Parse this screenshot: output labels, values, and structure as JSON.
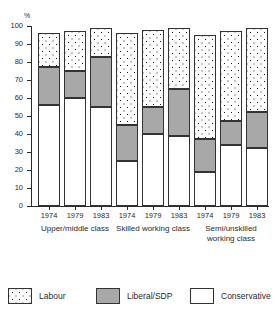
{
  "chart_data": {
    "type": "bar",
    "subtype": "stacked-vertical-grouped",
    "title": "",
    "xlabel": "",
    "ylabel": "%",
    "ylim": [
      0,
      100
    ],
    "yticks": [
      0,
      10,
      20,
      30,
      40,
      50,
      60,
      70,
      80,
      90,
      100
    ],
    "ytick_labels": [
      "0",
      "10",
      "20",
      "30",
      "40",
      "50",
      "60",
      "70",
      "80",
      "90",
      "100"
    ],
    "grid": false,
    "legend_position": "bottom",
    "stack_order_bottom_to_top": [
      "Conservative",
      "Liberal/SDP",
      "Labour"
    ],
    "x": [
      "1974",
      "1979",
      "1983"
    ],
    "groups": [
      {
        "label": "Upper/middle class",
        "label_lines": [
          "Upper/middle class"
        ],
        "years": [
          "1974",
          "1979",
          "1983"
        ],
        "Conservative": [
          56,
          60,
          55
        ],
        "Liberal/SDP": [
          21,
          15,
          28
        ],
        "Labour": [
          19,
          22,
          16
        ],
        "totals": [
          96,
          97,
          99
        ]
      },
      {
        "label": "Skilled working class",
        "label_lines": [
          "Skilled working class"
        ],
        "years": [
          "1974",
          "1979",
          "1983"
        ],
        "Conservative": [
          25,
          40,
          39
        ],
        "Liberal/SDP": [
          20,
          15,
          26
        ],
        "Labour": [
          51,
          43,
          34
        ],
        "totals": [
          96,
          98,
          99
        ]
      },
      {
        "label": "Semi/unskilled working class",
        "label_lines": [
          "Semi/unskilled",
          "working class"
        ],
        "years": [
          "1974",
          "1979",
          "1983"
        ],
        "Conservative": [
          19,
          34,
          32
        ],
        "Liberal/SDP": [
          18,
          13,
          20
        ],
        "Labour": [
          58,
          50,
          47
        ],
        "totals": [
          95,
          97,
          99
        ]
      }
    ],
    "series": [
      {
        "name": "Labour",
        "pattern": "dotted",
        "color": "#ffffff"
      },
      {
        "name": "Liberal/SDP",
        "pattern": "solid-grey",
        "color": "#a8a8a8"
      },
      {
        "name": "Conservative",
        "pattern": "blank",
        "color": "#ffffff"
      }
    ],
    "legend": [
      {
        "key": "labour",
        "label": "Labour"
      },
      {
        "key": "liberal-sdp",
        "label": "Liberal/SDP"
      },
      {
        "key": "conservative",
        "label": "Conservative"
      }
    ]
  }
}
